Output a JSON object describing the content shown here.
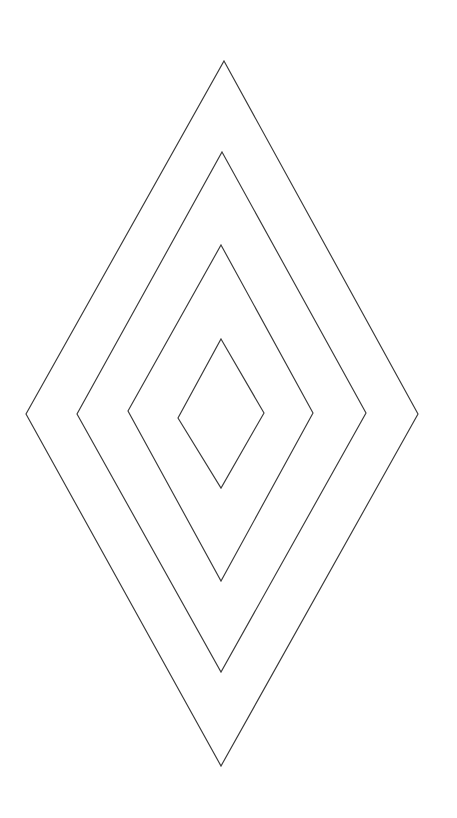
{
  "page": {
    "background_color": "#ffffff",
    "width": 457,
    "height": 818
  },
  "figure": {
    "name": "concentric-diamonds",
    "stroke_color": "#3a3a3a",
    "fill_color": "none",
    "stroke_width": 1.15,
    "shape_count": 4
  },
  "chart_data": {
    "type": "scatter",
    "xlabel": "",
    "ylabel": "",
    "grid": false,
    "legend": "none",
    "xlim": [
      0,
      457
    ],
    "ylim": [
      818,
      0
    ],
    "shapes": [
      {
        "name": "diamond-outer",
        "index": 1,
        "label": "Diamond 1 (outermost)",
        "points": [
          [
            224,
            61
          ],
          [
            418,
            414
          ],
          [
            221,
            766
          ],
          [
            26,
            414
          ]
        ],
        "center": [
          222,
          414
        ],
        "half_width": 196,
        "half_height": 352
      },
      {
        "name": "diamond-second",
        "index": 2,
        "label": "Diamond 2",
        "points": [
          [
            222,
            152
          ],
          [
            366,
            413
          ],
          [
            221,
            672
          ],
          [
            77,
            414
          ]
        ],
        "center": [
          222,
          413
        ],
        "half_width": 145,
        "half_height": 260
      },
      {
        "name": "diamond-third",
        "index": 3,
        "label": "Diamond 3",
        "points": [
          [
            221,
            245
          ],
          [
            313,
            413
          ],
          [
            221,
            581
          ],
          [
            128,
            411
          ]
        ],
        "center": [
          221,
          413
        ],
        "half_width": 93,
        "half_height": 168
      },
      {
        "name": "diamond-inner",
        "index": 4,
        "label": "Diamond 4 (innermost)",
        "points": [
          [
            221,
            339
          ],
          [
            264,
            413
          ],
          [
            221,
            488
          ],
          [
            178,
            418
          ]
        ],
        "center": [
          221,
          413
        ],
        "half_width": 43,
        "half_height": 75
      }
    ]
  }
}
